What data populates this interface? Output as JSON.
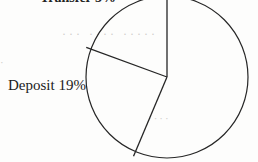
{
  "figure": {
    "background_color": "#fdfdfc",
    "stroke_color": "#262626"
  },
  "labels": {
    "top_clipped": "Transfer 5%",
    "deposit": "Deposit 19%"
  },
  "ghost_text": {
    "upper": "··· ···· ·····",
    "lower": "····",
    "left": "·"
  },
  "chart_data": {
    "type": "pie",
    "title": "",
    "xlabel": "",
    "ylabel": "",
    "grid": false,
    "legend_position": "none",
    "center": {
      "x": 167,
      "y": 77
    },
    "radius": 81,
    "start_angle_deg": 90,
    "direction": "clockwise",
    "categories": [
      "Major",
      "Transfer",
      "Deposit"
    ],
    "values": [
      56,
      25,
      19
    ],
    "labels_shown": [
      "Transfer 5%",
      "Deposit 19%"
    ],
    "slices": [
      {
        "name": "Major",
        "percent": 56,
        "angle_deg": 203,
        "start_deg": 90,
        "end_deg": -113,
        "label_visible": false,
        "label_text": ""
      },
      {
        "name": "Transfer",
        "percent": 25,
        "angle_deg": 87,
        "start_deg": -113,
        "end_deg": -200,
        "label_visible": true,
        "label_text": "Transfer 5%"
      },
      {
        "name": "Deposit",
        "percent": 19,
        "angle_deg": 70,
        "start_deg": -200,
        "end_deg": -270,
        "label_visible": true,
        "label_text": "Deposit 19%"
      }
    ],
    "boundary_endpoints": [
      {
        "label": "top-vertical",
        "x": 167,
        "y": 2
      },
      {
        "label": "upper-left",
        "x": 96,
        "y": 51
      },
      {
        "label": "lower-left",
        "x": 137,
        "y": 148
      }
    ]
  }
}
